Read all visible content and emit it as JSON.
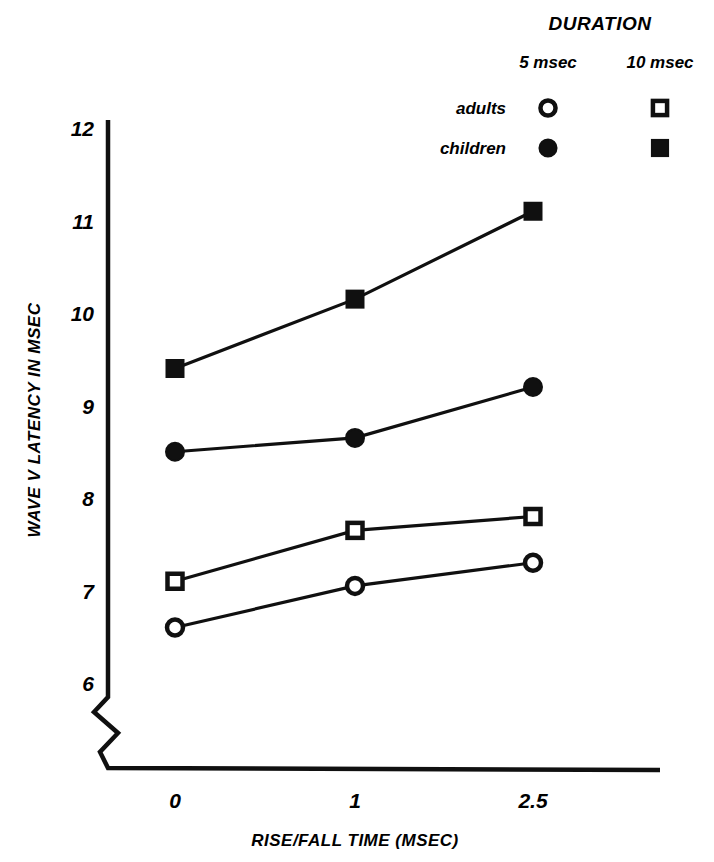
{
  "chart_data": {
    "type": "line",
    "title": "",
    "xlabel": "RISE/FALL TIME   (MSEC)",
    "ylabel": "WAVE V LATENCY IN MSEC",
    "categories": [
      "0",
      "1",
      "2.5"
    ],
    "x_tick_labels": [
      "0",
      "1",
      "2.5"
    ],
    "y_tick_labels": [
      "6",
      "7",
      "8",
      "9",
      "10",
      "11",
      "12"
    ],
    "y_ticks": [
      6,
      7,
      8,
      9,
      10,
      11,
      12
    ],
    "ylim": [
      6,
      12
    ],
    "y_axis_break": true,
    "grid": false,
    "legend_position": "top-right",
    "series": [
      {
        "name": "children 10 msec",
        "group": "children",
        "duration": "10 msec",
        "marker": "filled-square",
        "values": [
          9.4,
          10.15,
          11.1
        ]
      },
      {
        "name": "children 5 msec",
        "group": "children",
        "duration": "5 msec",
        "marker": "filled-circle",
        "values": [
          8.5,
          8.65,
          9.2
        ]
      },
      {
        "name": "adults 10 msec",
        "group": "adults",
        "duration": "10 msec",
        "marker": "open-square",
        "values": [
          7.1,
          7.65,
          7.8
        ]
      },
      {
        "name": "adults 5 msec",
        "group": "adults",
        "duration": "5 msec",
        "marker": "open-circle",
        "values": [
          6.6,
          7.05,
          7.3
        ]
      }
    ]
  },
  "legend": {
    "title": "DURATION",
    "columns": [
      "5 msec",
      "10 msec"
    ],
    "rows": [
      {
        "label": "adults",
        "markers": [
          "open-circle",
          "open-square"
        ]
      },
      {
        "label": "children",
        "markers": [
          "filled-circle",
          "filled-square"
        ]
      }
    ]
  },
  "axes": {
    "y_title": "WAVE V LATENCY IN MSEC",
    "x_title": "RISE/FALL TIME   (MSEC)"
  },
  "colors": {
    "ink": "#101010",
    "background": "#ffffff"
  },
  "caption": {
    "text": ""
  }
}
